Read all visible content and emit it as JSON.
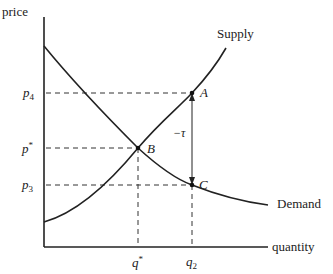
{
  "diagram": {
    "axes": {
      "y_label": "price",
      "x_label": "quantity"
    },
    "curves": {
      "supply_label": "Supply",
      "demand_label": "Demand"
    },
    "price_ticks": {
      "p4": "p",
      "p4_sub": "4",
      "pstar": "p",
      "pstar_sup": "*",
      "p3": "p",
      "p3_sub": "3"
    },
    "quantity_ticks": {
      "qstar": "q",
      "qstar_sup": "*",
      "q2": "q",
      "q2_sub": "2"
    },
    "points": {
      "A": "A",
      "B": "B",
      "C": "C"
    },
    "wedge_label": "−τ",
    "colors": {
      "line": "#222222",
      "dash": "#333333",
      "background": "#ffffff"
    }
  }
}
